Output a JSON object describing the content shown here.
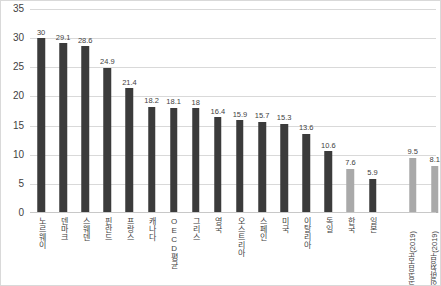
{
  "chart_data": {
    "type": "bar",
    "title": "",
    "xlabel": "",
    "ylabel": "",
    "ylim": [
      0,
      35
    ],
    "ytick_step": 5,
    "yticks": [
      "0",
      "5",
      "10",
      "15",
      "20",
      "25",
      "30",
      "35"
    ],
    "grid": true,
    "legend": "none",
    "colors": {
      "primary_dark": "#3b3b3b",
      "highlight_gray": "#a9a9a9",
      "gridline": "#d9d9d9",
      "text": "#3f3f3f"
    },
    "categories": [
      "노르웨이",
      "덴마크",
      "스웨덴",
      "핀란드",
      "프랑스",
      "캐나다",
      "OECD평균",
      "그리스",
      "영국",
      "오스트리아",
      "스페인",
      "미국",
      "이탈리아",
      "독일",
      "한국",
      "일본",
      "공공부문(2019)",
      "일반정부(2019)"
    ],
    "values": [
      30,
      29.1,
      28.6,
      24.9,
      21.4,
      18.2,
      18.1,
      18,
      16.4,
      15.9,
      15.7,
      15.3,
      13.6,
      10.6,
      7.6,
      5.9,
      9.5,
      8.1
    ],
    "value_labels": [
      "30",
      "29.1",
      "28.6",
      "24.9",
      "21.4",
      "18.2",
      "18.1",
      "18",
      "16.4",
      "15.9",
      "15.7",
      "15.3",
      "13.6",
      "10.6",
      "7.6",
      "5.9",
      "9.5",
      "8.1"
    ],
    "bar_colors": [
      "dark",
      "dark",
      "dark",
      "dark",
      "dark",
      "dark",
      "dark",
      "dark",
      "dark",
      "dark",
      "dark",
      "dark",
      "dark",
      "dark",
      "gray",
      "dark",
      "gray",
      "gray"
    ],
    "label_rotated": [
      false,
      false,
      false,
      false,
      false,
      false,
      false,
      false,
      false,
      false,
      false,
      false,
      false,
      false,
      false,
      false,
      true,
      true
    ],
    "group_gap_after_index": 15
  }
}
